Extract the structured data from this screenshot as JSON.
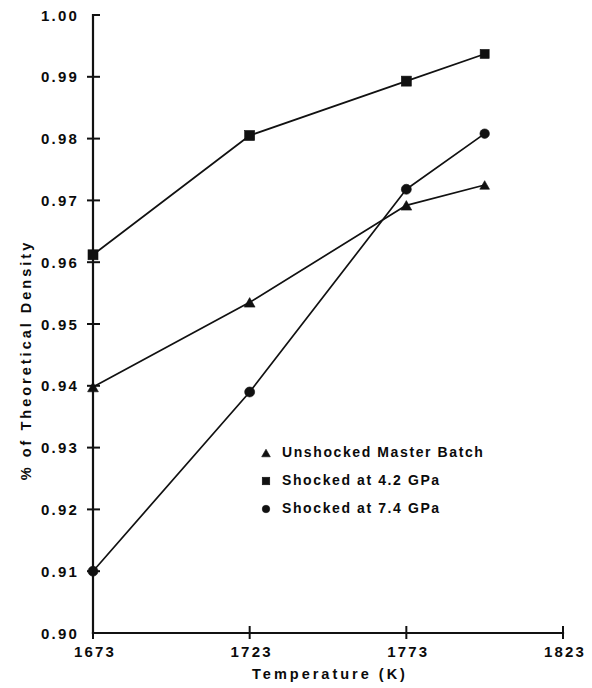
{
  "chart_data": {
    "type": "line",
    "title": "",
    "xlabel": "Temperature   (K)",
    "ylabel": "% of Theoretical Density",
    "xlim": [
      1673,
      1823
    ],
    "ylim": [
      0.9,
      1.0
    ],
    "grid": false,
    "legend_position": "center-right-inside",
    "x_ticks": [
      "1673",
      "1723",
      "1773",
      "1823"
    ],
    "x_tick_values": [
      1673,
      1723,
      1773,
      1823
    ],
    "y_ticks": [
      "0.90",
      "0.91",
      "0.92",
      "0.93",
      "0.94",
      "0.95",
      "0.96",
      "0.97",
      "0.98",
      "0.99",
      "1.00"
    ],
    "y_tick_values": [
      0.9,
      0.91,
      0.92,
      0.93,
      0.94,
      0.95,
      0.96,
      0.97,
      0.98,
      0.99,
      1.0
    ],
    "series": [
      {
        "name": "Unshocked Master Batch",
        "marker": "triangle",
        "color": "#111111",
        "x": [
          1673,
          1723,
          1773,
          1798
        ],
        "values": [
          0.9398,
          0.9535,
          0.9692,
          0.9725
        ]
      },
      {
        "name": "Shocked at 4.2 GPa",
        "marker": "square",
        "color": "#111111",
        "x": [
          1673,
          1723,
          1773,
          1798
        ],
        "values": [
          0.9612,
          0.9805,
          0.9893,
          0.9937
        ]
      },
      {
        "name": "Shocked at 7.4 GPa",
        "marker": "circle",
        "color": "#111111",
        "x": [
          1673,
          1723,
          1773,
          1798
        ],
        "values": [
          0.91,
          0.939,
          0.9718,
          0.9808
        ]
      }
    ]
  },
  "legend": {
    "entries": [
      {
        "label": "Unshocked Master Batch",
        "marker": "triangle"
      },
      {
        "label": "Shocked at 4.2 GPa",
        "marker": "square"
      },
      {
        "label": "Shocked at 7.4 GPa",
        "marker": "circle"
      }
    ]
  }
}
